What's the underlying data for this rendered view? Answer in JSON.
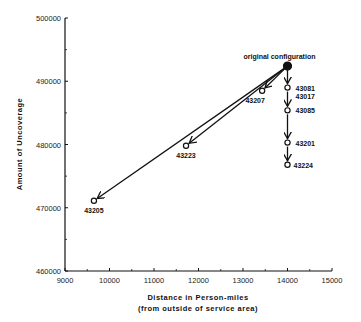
{
  "chart_data": {
    "type": "scatter",
    "title": "",
    "xlabel": "Distance in Person-miles",
    "xlabel_sub": "(from outside of service area)",
    "ylabel": "Amount of Uncoverage",
    "xlim": [
      9000,
      15000
    ],
    "ylim": [
      460000,
      500000
    ],
    "xticks": [
      9000,
      10000,
      11000,
      12000,
      13000,
      14000,
      15000
    ],
    "yticks": [
      460000,
      470000,
      480000,
      490000,
      500000
    ],
    "grid": false,
    "legend": null,
    "points": [
      {
        "label": "original configuration",
        "x": 14000,
        "y": 492400,
        "filled": true
      },
      {
        "label": "43081",
        "x": 14000,
        "y": 489000,
        "filled": false
      },
      {
        "label": "43017",
        "x": 14000,
        "y": 489000,
        "filled": false
      },
      {
        "label": "43207",
        "x": 13430,
        "y": 488500,
        "filled": false
      },
      {
        "label": "43085",
        "x": 14000,
        "y": 485400,
        "filled": false
      },
      {
        "label": "43201",
        "x": 14000,
        "y": 480300,
        "filled": false
      },
      {
        "label": "43224",
        "x": 14000,
        "y": 476800,
        "filled": false
      },
      {
        "label": "43223",
        "x": 11720,
        "y": 479800,
        "filled": false
      },
      {
        "label": "43205",
        "x": 9650,
        "y": 471100,
        "filled": false
      }
    ],
    "arrows": [
      {
        "from": "original configuration",
        "to": "43081"
      },
      {
        "from": "43081",
        "to": "43085"
      },
      {
        "from": "43085",
        "to": "43201"
      },
      {
        "from": "43201",
        "to": "43224"
      },
      {
        "from": "original configuration",
        "to": "43207"
      },
      {
        "from": "original configuration",
        "to": "43223"
      },
      {
        "from": "original configuration",
        "to": "43205"
      }
    ],
    "annotations": [
      "original configuration"
    ]
  }
}
